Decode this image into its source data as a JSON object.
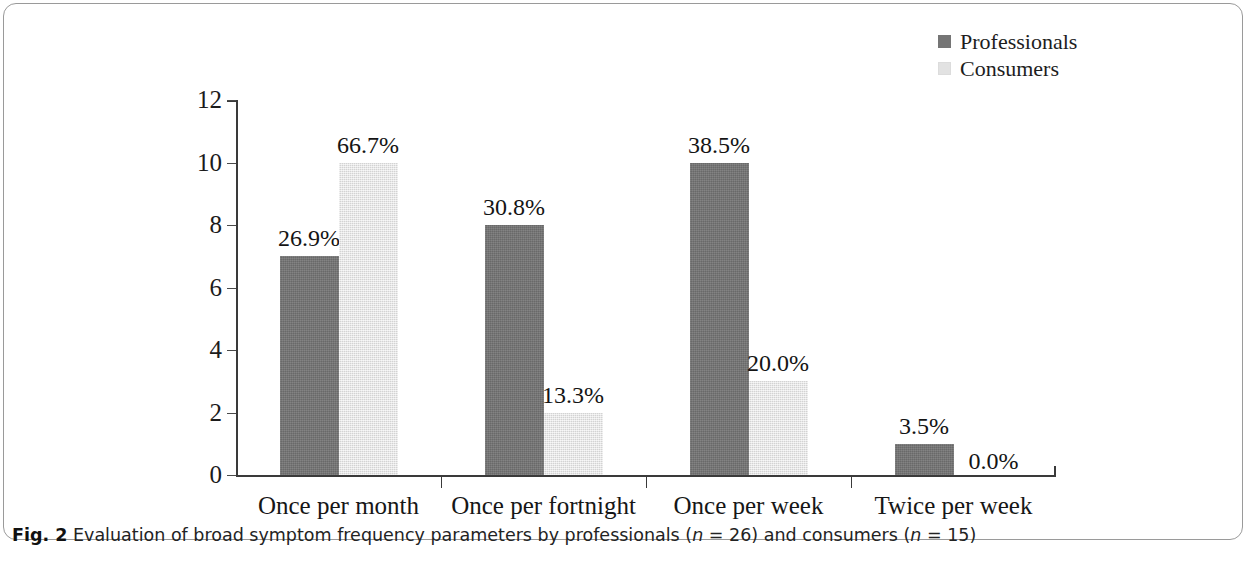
{
  "figure": {
    "number_label": "Fig. 2",
    "caption_part1": "Evaluation of broad symptom frequency parameters by professionals (",
    "caption_n1_var": "n",
    "caption_n1_val": " = 26) and consumers (",
    "caption_n2_var": "n",
    "caption_n2_val": " = 15)"
  },
  "legend": {
    "position": "top-right",
    "entries": [
      {
        "label": "Professionals",
        "color": "#757575"
      },
      {
        "label": "Consumers",
        "color": "#e2e2e2"
      }
    ]
  },
  "axis": {
    "y_ticks": [
      "0",
      "2",
      "4",
      "6",
      "8",
      "10",
      "12"
    ],
    "y_min": 0,
    "y_max": 12
  },
  "chart_data": {
    "type": "bar",
    "title": "",
    "subtitle": "",
    "xlabel": "",
    "ylabel": "",
    "ylim": [
      0,
      12
    ],
    "ytick_step": 2,
    "grid": false,
    "legend_position": "top-right",
    "categories": [
      "Once per month",
      "Once per fortnight",
      "Once per week",
      "Twice per week"
    ],
    "series": [
      {
        "name": "Professionals",
        "color": "#757575",
        "n": 26,
        "values": [
          7,
          8,
          10,
          1
        ],
        "labels": [
          "26.9%",
          "30.8%",
          "38.5%",
          "3.5%"
        ]
      },
      {
        "name": "Consumers",
        "color": "#e2e2e2",
        "n": 15,
        "values": [
          10,
          2,
          3,
          0
        ],
        "labels": [
          "66.7%",
          "13.3%",
          "20.0%",
          "0.0%"
        ]
      }
    ]
  }
}
